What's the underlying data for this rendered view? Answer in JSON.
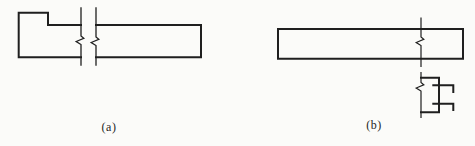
{
  "page": {
    "background": "#fbfbf9",
    "ink": "#1f1f1f",
    "width": 475,
    "height": 146
  },
  "figures": [
    {
      "id": "a",
      "label": "(a)",
      "description": "Elevation of a stepped bar (raised block at left end) shortened with a conventional break symbol: two vertical lines with zigzag break marks interrupting the member",
      "strokes": [
        {
          "name": "stepped-bar-left-outline",
          "width": 2,
          "points": [
            [
              81,
              25
            ],
            [
              48,
              25
            ],
            [
              48,
              12.7
            ],
            [
              18.7,
              12.7
            ],
            [
              18.7,
              57.3
            ],
            [
              81,
              57.3
            ]
          ]
        },
        {
          "name": "stepped-bar-right-outline",
          "width": 2,
          "points": [
            [
              96,
              25
            ],
            [
              201,
              25
            ],
            [
              201,
              57.3
            ],
            [
              96,
              57.3
            ]
          ]
        },
        {
          "name": "break-line-left-with-zigzag",
          "width": 1.3,
          "points": [
            [
              81,
              8
            ],
            [
              81,
              36
            ],
            [
              83.8,
              38.3
            ],
            [
              76.2,
              41.5
            ],
            [
              81,
              44.5
            ],
            [
              81,
              65
            ]
          ]
        },
        {
          "name": "break-line-right-with-zigzag",
          "width": 1.3,
          "points": [
            [
              96,
              8
            ],
            [
              96,
              37
            ],
            [
              98.8,
              39.3
            ],
            [
              91.2,
              42.5
            ],
            [
              96,
              45.5
            ],
            [
              96,
              65
            ]
          ]
        }
      ]
    },
    {
      "id": "b",
      "label": "(b)",
      "description": "Elevation of a prismatic bar crossed near its right end by a vertical centerline with zigzag break marks; below, a small connection/section detail with two hooked bars",
      "strokes": [
        {
          "name": "bar-outline",
          "width": 2,
          "closed": true,
          "points": [
            [
              278,
              29
            ],
            [
              463,
              29
            ],
            [
              463,
              58.7
            ],
            [
              278,
              58.7
            ]
          ]
        },
        {
          "name": "centerline-upper-with-zigzag",
          "width": 1.2,
          "points": [
            [
              421,
              18
            ],
            [
              421,
              37
            ],
            [
              423.8,
              39.3
            ],
            [
              416.2,
              42.5
            ],
            [
              421,
              45.5
            ],
            [
              421,
              66.5
            ]
          ]
        },
        {
          "name": "centerline-lower-with-zigzag",
          "width": 1.2,
          "points": [
            [
              421,
              72.5
            ],
            [
              421,
              82.5
            ],
            [
              423.8,
              84.8
            ],
            [
              416.2,
              88
            ],
            [
              421,
              91
            ],
            [
              421,
              117.5
            ]
          ]
        },
        {
          "name": "connection-box-outline",
          "width": 2,
          "points": [
            [
              421,
              77.7
            ],
            [
              439,
              77.7
            ],
            [
              439,
              112.3
            ],
            [
              421,
              112.3
            ]
          ]
        },
        {
          "name": "upper-hooked-bar",
          "width": 2,
          "points": [
            [
              433.3,
              85.3
            ],
            [
              453.3,
              85.3
            ],
            [
              453.3,
              92
            ]
          ]
        },
        {
          "name": "lower-hooked-bar",
          "width": 2,
          "points": [
            [
              433.3,
              103.7
            ],
            [
              453.3,
              103.7
            ],
            [
              453.3,
              110
            ]
          ]
        }
      ]
    }
  ]
}
